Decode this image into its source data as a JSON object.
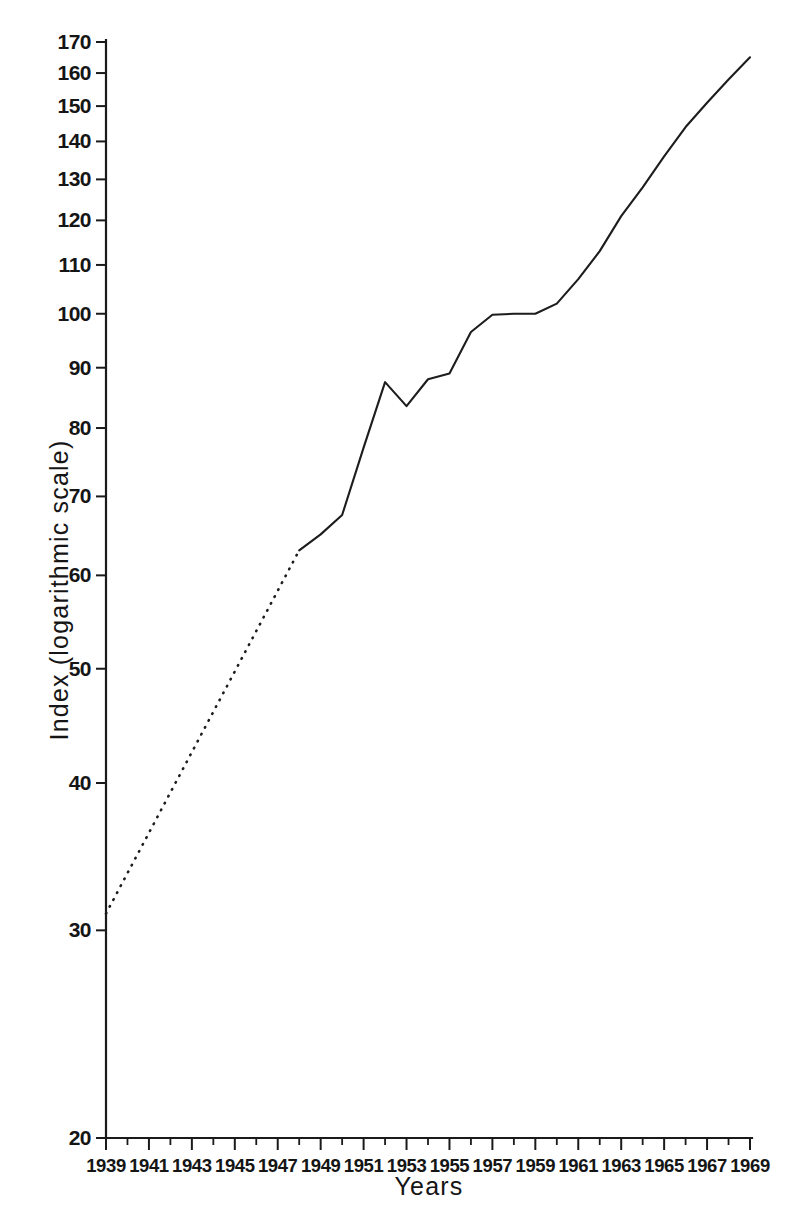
{
  "chart_data": {
    "type": "line",
    "title": "",
    "xlabel": "Years",
    "ylabel": "Index (logarithmic scale)",
    "yscale": "log",
    "ylim": [
      20,
      170
    ],
    "xlim": [
      1939,
      1969
    ],
    "grid": false,
    "legend": null,
    "y_ticks": [
      20,
      30,
      40,
      50,
      60,
      70,
      80,
      90,
      100,
      110,
      120,
      130,
      140,
      150,
      160,
      170
    ],
    "y_tick_labels": [
      "20",
      "30",
      "40",
      "50",
      "60",
      "70",
      "80",
      "90",
      "100",
      "110",
      "120",
      "130",
      "140",
      "150",
      "160",
      "170"
    ],
    "x_ticks": [
      1939,
      1941,
      1943,
      1945,
      1947,
      1949,
      1951,
      1953,
      1955,
      1957,
      1959,
      1961,
      1963,
      1965,
      1967,
      1969
    ],
    "x_tick_labels": [
      "1939",
      "1941",
      "1943",
      "1945",
      "1947",
      "1949",
      "1951",
      "1953",
      "1955",
      "1957",
      "1959",
      "1961",
      "1963",
      "1965",
      "1967",
      "1969"
    ],
    "x_minor_ticks": [
      1940,
      1942,
      1944,
      1946,
      1948,
      1950,
      1952,
      1954,
      1956,
      1958,
      1960,
      1962,
      1964,
      1966,
      1968
    ],
    "series": [
      {
        "name": "Index",
        "style": "dotted",
        "note": "interpolated / estimated segment",
        "x": [
          1939,
          1948
        ],
        "values": [
          31.0,
          63.0
        ]
      },
      {
        "name": "Index",
        "style": "solid",
        "note": "observed segment",
        "x": [
          1948,
          1949,
          1950,
          1951,
          1952,
          1953,
          1954,
          1955,
          1956,
          1957,
          1958,
          1959,
          1960,
          1961,
          1962,
          1963,
          1964,
          1965,
          1966,
          1967,
          1968,
          1969
        ],
        "values": [
          63.0,
          65.0,
          67.5,
          77.0,
          87.5,
          83.5,
          88.0,
          89.0,
          96.5,
          99.8,
          100.0,
          100.0,
          102.0,
          107.0,
          113.0,
          121.0,
          128.0,
          136.0,
          144.0,
          151.0,
          158.0,
          165.0
        ]
      }
    ],
    "colors": {
      "line": "#1d1d1d",
      "axis": "#1a1a1a",
      "background": "#ffffff"
    }
  }
}
